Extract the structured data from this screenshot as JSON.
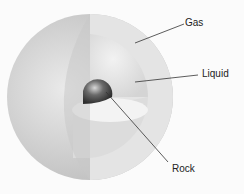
{
  "diagram": {
    "labels": {
      "gas": "Gas",
      "liquid": "Liquid",
      "rock": "Rock"
    },
    "colors": {
      "background": "#fbfbfb",
      "outer_shell": "#d9d9d9",
      "cut_face": "#e6e6e6",
      "core": "#555555",
      "leader_line": "#333333"
    }
  }
}
